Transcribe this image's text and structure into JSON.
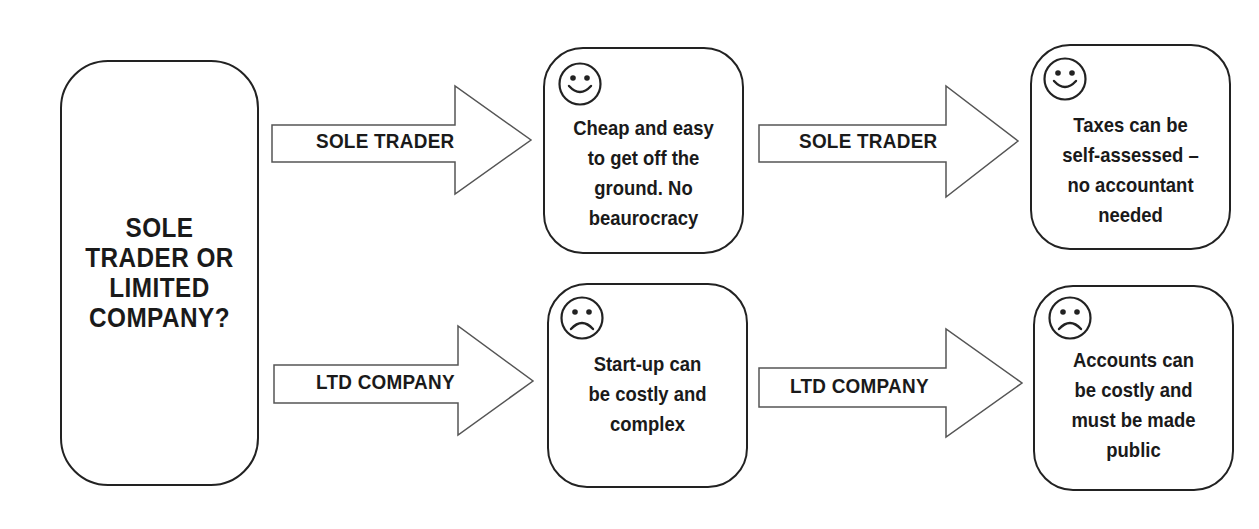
{
  "diagram": {
    "question": "SOLE\nTRADER OR\nLIMITED\nCOMPANY?",
    "colors": {
      "stroke": "#222222",
      "arrow_stroke": "#555555",
      "background": "#ffffff",
      "text": "#1a1a1a"
    },
    "branches": [
      {
        "name": "sole-trader",
        "arrow_label_1": "SOLE TRADER",
        "arrow_label_2": "SOLE TRADER",
        "step_1": {
          "icon": "smiley-face-icon",
          "text": "Cheap and easy\nto get off the\nground. No\nbeaurocracy"
        },
        "step_2": {
          "icon": "smiley-face-icon",
          "text": "Taxes can be\nself-assessed –\nno accountant\nneeded"
        }
      },
      {
        "name": "ltd-company",
        "arrow_label_1": "LTD COMPANY",
        "arrow_label_2": "LTD COMPANY",
        "step_1": {
          "icon": "frowning-face-icon",
          "text": "Start-up can\nbe costly and\ncomplex"
        },
        "step_2": {
          "icon": "frowning-face-icon",
          "text": "Accounts can\nbe costly and\nmust be made\npublic"
        }
      }
    ]
  }
}
